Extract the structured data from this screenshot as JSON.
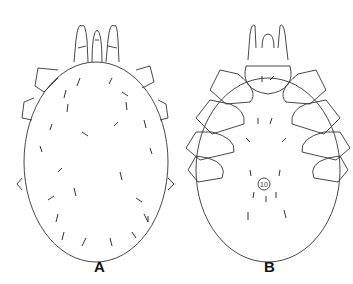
{
  "figure": {
    "panels": [
      {
        "label": "A",
        "view": "dorsal"
      },
      {
        "label": "B",
        "view": "ventral"
      }
    ],
    "colors": {
      "line": "#333333",
      "background": "#ffffff"
    }
  }
}
